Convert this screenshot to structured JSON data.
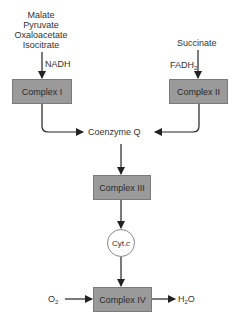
{
  "diagram": {
    "nadh_sources": [
      "Malate",
      "Pyruvate",
      "Oxaloacetate",
      "Isocitrate"
    ],
    "nadh_label": "NADH",
    "fadh_source": "Succinate",
    "fadh_label": "FADH",
    "fadh_sub": "2",
    "complex1": "Complex I",
    "complex2": "Complex II",
    "coenzyme_q": "Coenzyme Q",
    "complex3": "Complex III",
    "cyt_c": "Cyt. ",
    "cyt_c_italic": "c",
    "complex4": "Complex IV",
    "o2": "O",
    "o2_sub": "2",
    "h2o_h": "H",
    "h2o_sub": "2",
    "h2o_o": "O",
    "colors": {
      "box_fill": "#9a9a9a",
      "box_border": "#7a7a7a",
      "line": "#222222"
    }
  }
}
